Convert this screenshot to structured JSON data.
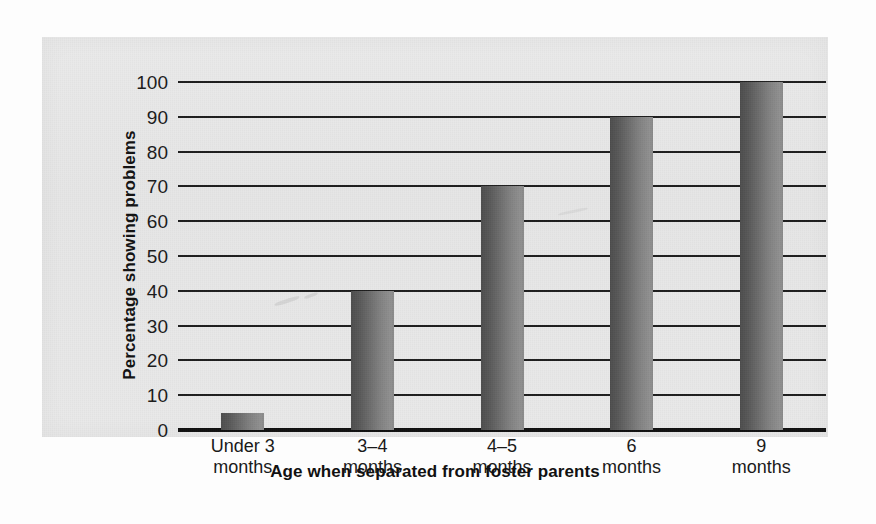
{
  "chart_data": {
    "type": "bar",
    "title": "",
    "xlabel": "Age when separated from foster parents",
    "ylabel": "Percentage showing problems",
    "categories": [
      "Under 3\nmonths",
      "3–4\nmonths",
      "4–5\nmonths",
      "6\nmonths",
      "9\nmonths"
    ],
    "category_lines": [
      [
        "Under 3",
        "months"
      ],
      [
        "3–4",
        "months"
      ],
      [
        "4–5",
        "months"
      ],
      [
        "6",
        "months"
      ],
      [
        "9",
        "months"
      ]
    ],
    "values": [
      5,
      40,
      70,
      90,
      100
    ],
    "ylim": [
      0,
      100
    ],
    "ytick_step": 10,
    "yticks": [
      100,
      90,
      80,
      70,
      60,
      50,
      40,
      30,
      20,
      10,
      0
    ],
    "ytick_labels": [
      "100",
      "90",
      "80",
      "70",
      "60",
      "50",
      "40",
      "30",
      "20",
      "10",
      "0"
    ],
    "grid": true,
    "legend": "none",
    "bar_color_dark": "#4d4d4d",
    "bar_color_light": "#909090",
    "gridline_color": "#1d1d1d",
    "panel_background": "#e8e8e8",
    "page_background": "#fdfdfd"
  }
}
